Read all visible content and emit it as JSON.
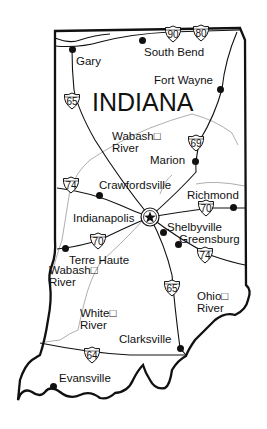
{
  "map": {
    "title": "INDIANA",
    "cities": [
      {
        "name": "Gary",
        "x": 72,
        "y": 49,
        "lx": 76,
        "ly": 55
      },
      {
        "name": "South Bend",
        "x": 142,
        "y": 40,
        "lx": 144,
        "ly": 46
      },
      {
        "name": "Fort Wayne",
        "x": 220,
        "y": 89,
        "lx": 154,
        "ly": 74
      },
      {
        "name": "Marion",
        "x": 195,
        "y": 161,
        "lx": 150,
        "ly": 154
      },
      {
        "name": "Crawfordsville",
        "x": 99,
        "y": 195,
        "lx": 99,
        "ly": 179
      },
      {
        "name": "Richmond",
        "x": 233,
        "y": 207,
        "lx": 187,
        "ly": 189
      },
      {
        "name": "Indianapolis",
        "x": 150,
        "y": 217,
        "lx": 73,
        "ly": 212
      },
      {
        "name": "Shelbyville",
        "x": 163,
        "y": 232,
        "lx": 167,
        "ly": 221
      },
      {
        "name": "Greensburg",
        "x": 178,
        "y": 244,
        "lx": 179,
        "ly": 233
      },
      {
        "name": "Terre Haute",
        "x": 65,
        "y": 248,
        "lx": 69,
        "ly": 254
      },
      {
        "name": "Clarksville",
        "x": 180,
        "y": 348,
        "lx": 119,
        "ly": 333
      },
      {
        "name": "Evansville",
        "x": 53,
        "y": 386,
        "lx": 59,
        "ly": 372
      }
    ],
    "rivers": [
      {
        "name": "Wabash River",
        "line1": "Wabash□",
        "line2": "River",
        "lx": 112,
        "ly": 130
      },
      {
        "name": "Wabash River",
        "line1": "Wabash□",
        "line2": "River",
        "lx": 49,
        "ly": 264
      },
      {
        "name": "White River",
        "line1": "White□",
        "line2": "River",
        "lx": 80,
        "ly": 307
      },
      {
        "name": "Ohio River",
        "line1": "Ohio□",
        "line2": "River",
        "lx": 197,
        "ly": 290
      }
    ],
    "highways": [
      {
        "number": "90",
        "x": 164,
        "y": 25
      },
      {
        "number": "80",
        "x": 192,
        "y": 24
      },
      {
        "number": "65",
        "x": 63,
        "y": 92
      },
      {
        "number": "69",
        "x": 187,
        "y": 134
      },
      {
        "number": "74",
        "x": 62,
        "y": 176
      },
      {
        "number": "70",
        "x": 197,
        "y": 199
      },
      {
        "number": "70",
        "x": 89,
        "y": 232
      },
      {
        "number": "74",
        "x": 196,
        "y": 246
      },
      {
        "number": "65",
        "x": 163,
        "y": 279
      },
      {
        "number": "64",
        "x": 83,
        "y": 346
      }
    ],
    "capital": {
      "name": "Indianapolis",
      "icon": "star-in-circle-icon",
      "x": 150,
      "y": 217
    }
  }
}
